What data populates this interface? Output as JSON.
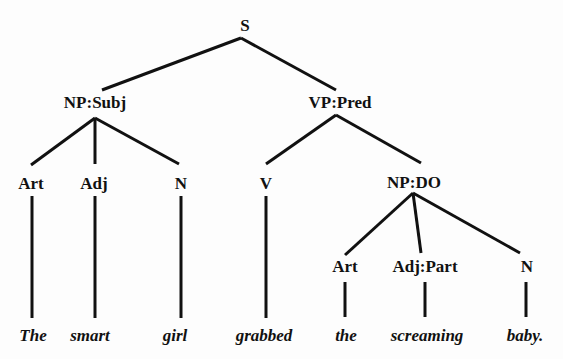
{
  "diagram": {
    "type": "syntax-tree",
    "line_color": "#111111",
    "text_color": "#111111",
    "background": "#fdfdfd",
    "nodes": [
      {
        "id": "s",
        "label": "S",
        "x": 245,
        "y": 25
      },
      {
        "id": "np_subj",
        "label": "NP:Subj",
        "x": 95,
        "y": 102
      },
      {
        "id": "vp_pred",
        "label": "VP:Pred",
        "x": 340,
        "y": 102
      },
      {
        "id": "art1",
        "label": "Art",
        "x": 31,
        "y": 183
      },
      {
        "id": "adj1",
        "label": "Adj",
        "x": 94,
        "y": 183
      },
      {
        "id": "n1",
        "label": "N",
        "x": 181,
        "y": 183
      },
      {
        "id": "v",
        "label": "V",
        "x": 266,
        "y": 183
      },
      {
        "id": "np_do",
        "label": "NP:DO",
        "x": 414,
        "y": 182
      },
      {
        "id": "art2",
        "label": "Art",
        "x": 345,
        "y": 266
      },
      {
        "id": "adjpart",
        "label": "Adj:Part",
        "x": 425,
        "y": 266
      },
      {
        "id": "n2",
        "label": "N",
        "x": 527,
        "y": 266
      }
    ],
    "words": [
      {
        "text": "The",
        "x": 33,
        "y": 335
      },
      {
        "text": "smart",
        "x": 90,
        "y": 335
      },
      {
        "text": "girl",
        "x": 175,
        "y": 335
      },
      {
        "text": "grabbed",
        "x": 264,
        "y": 335
      },
      {
        "text": "the",
        "x": 346,
        "y": 335
      },
      {
        "text": "screaming",
        "x": 427,
        "y": 335
      },
      {
        "text": "baby.",
        "x": 525,
        "y": 335
      }
    ],
    "edges": [
      {
        "from": "s",
        "to": "np_subj",
        "x1": 241,
        "y1": 38,
        "x2": 102,
        "y2": 90
      },
      {
        "from": "s",
        "to": "vp_pred",
        "x1": 241,
        "y1": 38,
        "x2": 336,
        "y2": 90
      },
      {
        "from": "np_subj",
        "to": "art1",
        "x1": 95,
        "y1": 118,
        "x2": 31,
        "y2": 165
      },
      {
        "from": "np_subj",
        "to": "adj1",
        "x1": 95,
        "y1": 118,
        "x2": 95,
        "y2": 164
      },
      {
        "from": "np_subj",
        "to": "n1",
        "x1": 95,
        "y1": 118,
        "x2": 179,
        "y2": 164
      },
      {
        "from": "vp_pred",
        "to": "v",
        "x1": 336,
        "y1": 115,
        "x2": 266,
        "y2": 164
      },
      {
        "from": "vp_pred",
        "to": "np_do",
        "x1": 336,
        "y1": 115,
        "x2": 421,
        "y2": 163
      },
      {
        "from": "np_do",
        "to": "art2",
        "x1": 413,
        "y1": 193,
        "x2": 345,
        "y2": 255
      },
      {
        "from": "np_do",
        "to": "adjpart",
        "x1": 413,
        "y1": 193,
        "x2": 421,
        "y2": 253
      },
      {
        "from": "np_do",
        "to": "n2",
        "x1": 413,
        "y1": 193,
        "x2": 520,
        "y2": 253
      },
      {
        "from": "art1",
        "to": "The",
        "x1": 32,
        "y1": 196,
        "x2": 32,
        "y2": 318
      },
      {
        "from": "adj1",
        "to": "smart",
        "x1": 95,
        "y1": 196,
        "x2": 95,
        "y2": 318
      },
      {
        "from": "n1",
        "to": "girl",
        "x1": 181,
        "y1": 196,
        "x2": 181,
        "y2": 318
      },
      {
        "from": "v",
        "to": "grabbed",
        "x1": 266,
        "y1": 196,
        "x2": 266,
        "y2": 318
      },
      {
        "from": "art2",
        "to": "the",
        "x1": 345,
        "y1": 282,
        "x2": 345,
        "y2": 317
      },
      {
        "from": "adjpart",
        "to": "screaming",
        "x1": 425,
        "y1": 282,
        "x2": 425,
        "y2": 317
      },
      {
        "from": "n2",
        "to": "baby.",
        "x1": 526,
        "y1": 282,
        "x2": 526,
        "y2": 317
      }
    ]
  }
}
